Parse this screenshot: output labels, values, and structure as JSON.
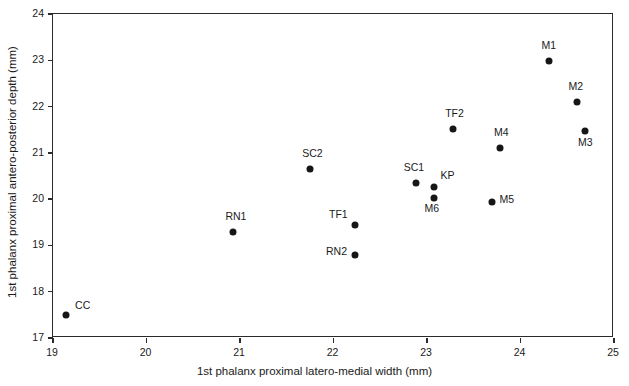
{
  "chart_data": {
    "type": "scatter",
    "title": "",
    "xlabel": "1st phalanx proximal latero-medial width (mm)",
    "ylabel": "1st phalanx proximal antero-posterior depth (mm)",
    "xlim": [
      19,
      25
    ],
    "ylim": [
      17,
      24
    ],
    "xticks": [
      19,
      20,
      21,
      22,
      23,
      24,
      25
    ],
    "yticks": [
      17,
      18,
      19,
      20,
      21,
      22,
      23,
      24
    ],
    "xtick_labels": [
      "19",
      "20",
      "21",
      "22",
      "23",
      "24",
      "25"
    ],
    "ytick_labels": [
      "17",
      "18",
      "19",
      "20",
      "21",
      "22",
      "23",
      "24"
    ],
    "grid": false,
    "legend": false,
    "marker": "filled-circle",
    "marker_color": "#161616",
    "points": [
      {
        "label": "CC",
        "x": 19.14,
        "y": 17.5,
        "label_dx": 9,
        "label_dy": -10
      },
      {
        "label": "RN1",
        "x": 20.93,
        "y": 19.3,
        "label_dx": -8,
        "label_dy": -16
      },
      {
        "label": "SC2",
        "x": 21.75,
        "y": 20.66,
        "label_dx": -8,
        "label_dy": -16
      },
      {
        "label": "TF1",
        "x": 22.23,
        "y": 19.44,
        "label_dx": -26,
        "label_dy": -11
      },
      {
        "label": "RN2",
        "x": 22.23,
        "y": 18.79,
        "label_dx": -29,
        "label_dy": -4
      },
      {
        "label": "SC1",
        "x": 22.88,
        "y": 20.35,
        "label_dx": -12,
        "label_dy": -16
      },
      {
        "label": "KP",
        "x": 23.07,
        "y": 20.26,
        "label_dx": 7,
        "label_dy": -12
      },
      {
        "label": "M6",
        "x": 23.07,
        "y": 20.02,
        "label_dx": -9,
        "label_dy": 10
      },
      {
        "label": "TF2",
        "x": 23.28,
        "y": 21.51,
        "label_dx": -8,
        "label_dy": -16
      },
      {
        "label": "M5",
        "x": 23.69,
        "y": 19.93,
        "label_dx": 8,
        "label_dy": -3
      },
      {
        "label": "M4",
        "x": 23.78,
        "y": 21.1,
        "label_dx": -6,
        "label_dy": -16
      },
      {
        "label": "M1",
        "x": 24.3,
        "y": 22.98,
        "label_dx": -7,
        "label_dy": -16
      },
      {
        "label": "M2",
        "x": 24.6,
        "y": 22.1,
        "label_dx": -8,
        "label_dy": -16
      },
      {
        "label": "M3",
        "x": 24.69,
        "y": 21.48,
        "label_dx": -7,
        "label_dy": 11
      }
    ]
  }
}
